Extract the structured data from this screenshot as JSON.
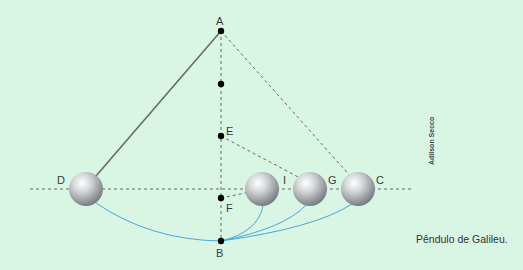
{
  "figure": {
    "caption": "Pêndulo de Galileu.",
    "credit": "Adilson Secco",
    "background_color": "#d9f5e4",
    "arc_color": "#4aa8d8",
    "string_color": "#666666",
    "dash_color": "#666666"
  },
  "points": {
    "A": {
      "label": "A",
      "x": 221,
      "y": 31
    },
    "M": {
      "label": "",
      "x": 221,
      "y": 84
    },
    "E": {
      "label": "E",
      "x": 221,
      "y": 136
    },
    "F": {
      "label": "F",
      "x": 221,
      "y": 198
    },
    "B": {
      "label": "B",
      "x": 221,
      "y": 241
    },
    "D": {
      "label": "D",
      "x": 86,
      "y": 189
    },
    "I": {
      "label": "I",
      "x": 262,
      "y": 189
    },
    "G": {
      "label": "G",
      "x": 310,
      "y": 189
    },
    "C": {
      "label": "C",
      "x": 358,
      "y": 189
    }
  },
  "labels": {
    "A": "A",
    "B": "B",
    "C": "C",
    "D": "D",
    "E": "E",
    "F": "F",
    "G": "G",
    "I": "I"
  }
}
